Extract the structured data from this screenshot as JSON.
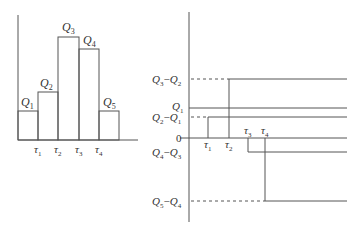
{
  "left_panel": {
    "bars": [
      {
        "label": "Q",
        "sub": "1"
      },
      {
        "label": "Q",
        "sub": "2"
      },
      {
        "label": "Q",
        "sub": "3"
      },
      {
        "label": "Q",
        "sub": "4"
      },
      {
        "label": "Q",
        "sub": "5"
      }
    ],
    "ticks": [
      {
        "label": "τ",
        "sub": "1"
      },
      {
        "label": "τ",
        "sub": "2"
      },
      {
        "label": "τ",
        "sub": "3"
      },
      {
        "label": "τ",
        "sub": "4"
      }
    ]
  },
  "right_panel": {
    "y_labels": {
      "q3_q2": {
        "a": "Q",
        "asub": "3",
        "dash": "−",
        "b": "Q",
        "bsub": "2"
      },
      "q1": {
        "a": "Q",
        "asub": "1"
      },
      "q2_q1": {
        "a": "Q",
        "asub": "2",
        "dash": "−",
        "b": "Q",
        "bsub": "1"
      },
      "zero": "0",
      "q4_q3": {
        "a": "Q",
        "asub": "4",
        "dash": "−",
        "b": "Q",
        "bsub": "3"
      },
      "q5_q4": {
        "a": "Q",
        "asub": "5",
        "dash": "−",
        "b": "Q",
        "bsub": "4"
      }
    },
    "ticks": [
      {
        "label": "τ",
        "sub": "1"
      },
      {
        "label": "τ",
        "sub": "2"
      },
      {
        "label": "τ",
        "sub": "3"
      },
      {
        "label": "τ",
        "sub": "4"
      }
    ]
  },
  "colors": {
    "line": "#555555",
    "text": "#333333"
  }
}
